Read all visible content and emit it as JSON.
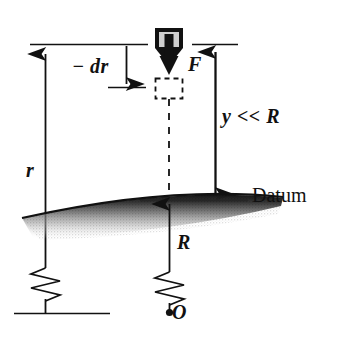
{
  "figure": {
    "background_color": "#ffffff",
    "ink_color": "#111111",
    "width": 339,
    "height": 341,
    "labels": {
      "minus_dr": "− dr",
      "force": "F",
      "small_height": "y << R",
      "radius_r": "r",
      "datum": "Datum",
      "earth_radius": "R",
      "origin": "O"
    },
    "elements": {
      "particle_box": "light-gray-square-block",
      "force_arrow": "thick-downward-arrow",
      "displaced_box": "dashed-square-outline",
      "dashed_line": "vertical-dashed-line",
      "earth_surface": "shaded-arc-surface",
      "break_symbol": "zigzag-line-break",
      "origin_dot": "filled-dot"
    },
    "colors": {
      "ink": "#111111",
      "box_fill": "#cfcfcf",
      "earth_dark": "#1a1a1a",
      "earth_light": "#ffffff"
    }
  }
}
